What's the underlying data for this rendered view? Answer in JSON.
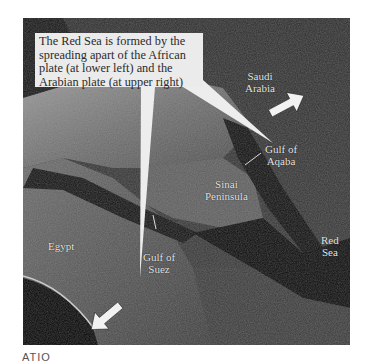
{
  "figure": {
    "type": "satellite-photo",
    "callout_text": "The Red Sea is formed by the spreading apart of the African plate (at lower left) and the Arabian plate (at upper right)",
    "labels": {
      "saudi_arabia_line1": "Saudi",
      "saudi_arabia_line2": "Arabia",
      "gulf_of_aqaba_line1": "Gulf of",
      "gulf_of_aqaba_line2": "Aqaba",
      "sinai_line1": "Sinai",
      "sinai_line2": "Peninsula",
      "egypt": "Egypt",
      "gulf_of_suez_line1": "Gulf of",
      "gulf_of_suez_line2": "Suez",
      "red_sea_line1": "Red",
      "red_sea_line2": "Sea"
    },
    "arrows": [
      {
        "name": "arabian-plate-arrow",
        "direction": "upper-right"
      },
      {
        "name": "african-plate-arrow",
        "direction": "lower-left"
      }
    ],
    "colors": {
      "callout_bg": "#ebebeb",
      "arrow": "#f2f2f2",
      "sea": "#0b0b0b",
      "land_light": "#8a8a8a",
      "land_dark": "#3a3a3a"
    }
  },
  "caption": {
    "partial_text": "ATIO"
  }
}
